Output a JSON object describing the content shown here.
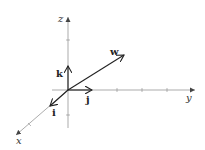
{
  "diagram": {
    "type": "3d-coordinate-axes",
    "axes": {
      "x_label": "x",
      "y_label": "y",
      "z_label": "z"
    },
    "unit_vectors": {
      "i_label": "i",
      "j_label": "j",
      "k_label": "k"
    },
    "vector": {
      "label": "w"
    },
    "colors": {
      "axis": "#888888",
      "vector": "#222222"
    }
  }
}
